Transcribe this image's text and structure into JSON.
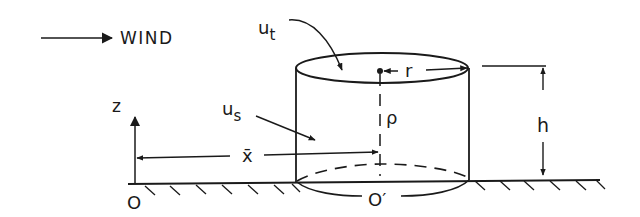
{
  "diagram": {
    "labels": {
      "wind": "WIND",
      "u_t_main": "u",
      "u_t_sub": "t",
      "u_s_main": "u",
      "u_s_sub": "s",
      "z": "z",
      "x_bar": "x̄",
      "rho": "ρ",
      "r": "r",
      "h": "h",
      "origin": "O",
      "origin_prime": "O′"
    },
    "colors": {
      "ink": "#1a1a1a",
      "background": "#ffffff"
    }
  }
}
